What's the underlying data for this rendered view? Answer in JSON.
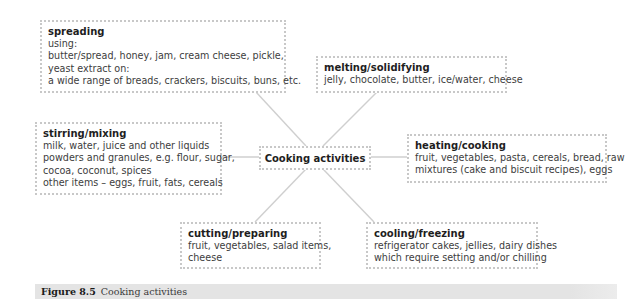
{
  "diagram": {
    "center": {
      "label": "Cooking activities"
    },
    "nodes": [
      {
        "id": "spreading",
        "title": "spreading",
        "lines": [
          "using:",
          "butter/spread, honey, jam, cream cheese, pickle,",
          "yeast extract on:",
          "a wide range of breads, crackers, biscuits, buns, etc."
        ]
      },
      {
        "id": "melting",
        "title": "melting/solidifying",
        "lines": [
          "jelly, chocolate, butter, ice/water, cheese"
        ]
      },
      {
        "id": "stirring",
        "title": "stirring/mixing",
        "lines": [
          "milk, water, juice and other liquids",
          "powders and granules, e.g. flour, sugar,",
          "cocoa, coconut, spices",
          "other items – eggs, fruit, fats, cereals"
        ]
      },
      {
        "id": "heating",
        "title": "heating/cooking",
        "lines": [
          "fruit, vegetables, pasta, cereals, bread, raw",
          "mixtures (cake and biscuit recipes), eggs"
        ]
      },
      {
        "id": "cutting",
        "title": "cutting/preparing",
        "lines": [
          "fruit, vegetables, salad items,",
          "cheese"
        ]
      },
      {
        "id": "cooling",
        "title": "cooling/freezing",
        "lines": [
          "refrigerator cakes, jellies, dairy dishes",
          "which require setting and/or chilling"
        ]
      }
    ],
    "colors": {
      "border": "#c8c8c8",
      "connector": "#cfcfcf",
      "caption_bg": "#e4e4e4"
    }
  },
  "caption": {
    "figure_number": "Figure 8.5",
    "text": "Cooking activities"
  }
}
